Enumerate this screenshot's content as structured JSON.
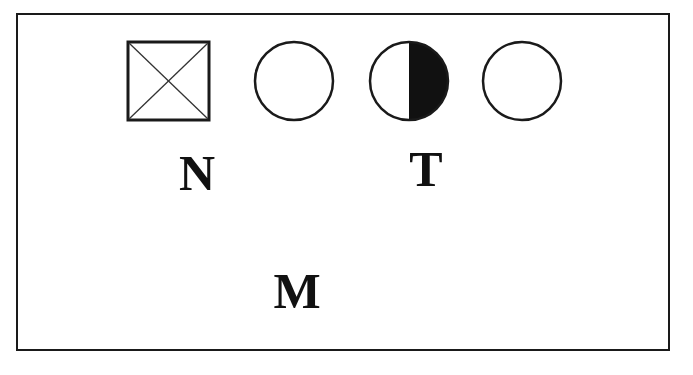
{
  "diagram": {
    "type": "pedigree-symbols",
    "symbols": [
      {
        "id": "s1",
        "shape": "square-crossed",
        "description": "square with diagonal X (deceased/unknown male)"
      },
      {
        "id": "s2",
        "shape": "circle",
        "fill": "none"
      },
      {
        "id": "s3",
        "shape": "circle-half-filled",
        "filled_half": "right"
      },
      {
        "id": "s4",
        "shape": "circle",
        "fill": "none"
      }
    ],
    "labels": {
      "n": "N",
      "t": "T",
      "m": "M"
    },
    "colors": {
      "stroke": "#1a1a1a",
      "fill": "#111111",
      "background": "#ffffff"
    }
  }
}
